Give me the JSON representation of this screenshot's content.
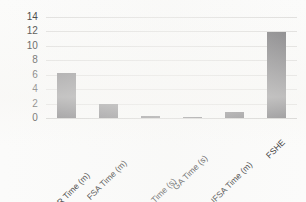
{
  "chart_data": {
    "type": "bar",
    "title": "",
    "subtitle": "",
    "xlabel": "",
    "ylabel": "",
    "categories": [
      "PSO-QR Time (m)",
      "FSA Time (m)",
      "RS-IHS-QR Time (s)",
      "GA Time (s)",
      "IFSA Time (m)",
      "FSHE"
    ],
    "values": [
      6.2,
      2.0,
      0.3,
      0.2,
      0.9,
      11.9
    ],
    "ylim": [
      0,
      14
    ],
    "yticks": [
      0,
      2,
      4,
      6,
      8,
      10,
      12,
      14
    ],
    "ytick_labels": [
      "0",
      "2",
      "4",
      "6",
      "8",
      "10",
      "12",
      "14"
    ],
    "grid": true,
    "legend": false,
    "legend_position": "none",
    "series": [
      {
        "name": "",
        "values": [
          6.2,
          2.0,
          0.3,
          0.2,
          0.9,
          11.9
        ]
      }
    ]
  },
  "style": {
    "bar_color": "#757477",
    "gridline_color": "#dedddb",
    "axis_color": "#cfcecc",
    "text_color": "#2b2b2b",
    "background": "#fbfbfa"
  }
}
